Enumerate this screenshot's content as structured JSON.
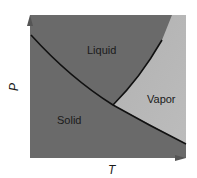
{
  "diagram": {
    "type": "phase-diagram",
    "axes": {
      "x_label": "T",
      "y_label": "P"
    },
    "regions": [
      {
        "name": "Liquid",
        "color": "#6e6e6e"
      },
      {
        "name": "Vapor",
        "color": "#b9b9b9"
      },
      {
        "name": "Solid",
        "color": "#686868"
      }
    ],
    "colors": {
      "line": "#111111",
      "axis": "#555555",
      "background": "#ffffff"
    }
  }
}
